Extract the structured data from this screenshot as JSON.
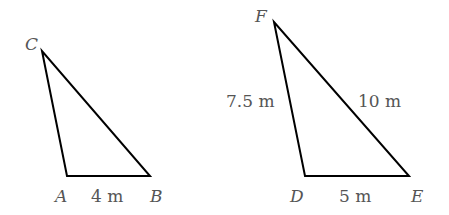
{
  "triangles": [
    {
      "name": "ABC",
      "vertices": {
        "C": [
          42,
          51
        ],
        "A": [
          67,
          176
        ],
        "B": [
          150,
          176
        ]
      },
      "labels": {
        "C": "C",
        "A": "A",
        "B": "B"
      },
      "sides": {
        "AB": "4 m"
      }
    },
    {
      "name": "DEF",
      "vertices": {
        "F": [
          274,
          22
        ],
        "D": [
          305,
          176
        ],
        "E": [
          409,
          176
        ]
      },
      "labels": {
        "F": "F",
        "D": "D",
        "E": "E"
      },
      "sides": {
        "DF": "7.5 m",
        "FE": "10 m",
        "DE": "5 m"
      }
    }
  ],
  "colors": {
    "stroke": "#000000",
    "label": "#555555"
  }
}
